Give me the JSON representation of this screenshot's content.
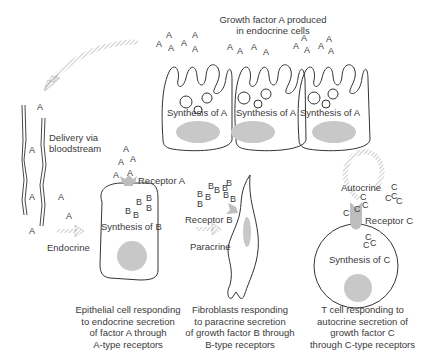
{
  "title": "Growth factor A produced in endocrine cells",
  "endocrine_cells": {
    "labels": [
      "Synthesis of A",
      "Synthesis of A",
      "Synthesis of A"
    ]
  },
  "bloodstream": {
    "label": "Delivery via bloodstream"
  },
  "panels": {
    "endocrine": {
      "arrow_label": "Endocrine",
      "receptor_label": "Receptor A",
      "synthesis_label": "Synthesis of B",
      "caption": "Epithelial cell responding to endocrine secretion of factor A through A-type receptors",
      "caption_lines": [
        "Epithelial cell responding",
        "to endocrine secretion",
        "of factor A through",
        "A-type receptors"
      ]
    },
    "paracrine": {
      "arrow_label": "Paracrine",
      "receptor_label": "Receptor B",
      "caption": "Fibroblasts responding to paracrine secretion of growth factor B through B-type receptors",
      "caption_lines": [
        "Fibroblasts responding",
        "to paracrine secretion",
        "of growth factor B through",
        "B-type receptors"
      ]
    },
    "autocrine": {
      "arrow_label": "Autocrine",
      "receptor_label": "Receptor C",
      "synthesis_label": "Synthesis of C",
      "caption": "T cell responding to autocrine secretion of growth factor C through C-type receptors",
      "caption_lines": [
        "T cell responding to",
        "autocrine secretion of",
        "growth factor C",
        "through C-type receptors"
      ]
    }
  },
  "symbols": {
    "a": "A",
    "b": "B",
    "c": "C"
  },
  "colors": {
    "outline": "#333333",
    "nucleus": "#c8c8c8",
    "receptor": "#bdbdbd",
    "arrow": "#b0b0b0"
  }
}
